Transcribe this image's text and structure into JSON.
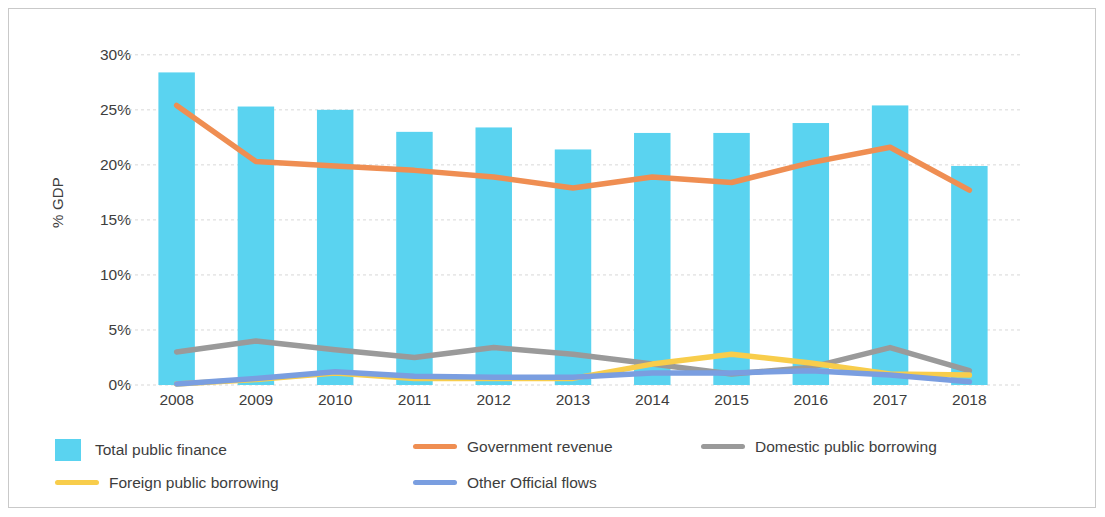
{
  "chart_data": {
    "type": "bar",
    "title": "",
    "xlabel": "",
    "ylabel": "% GDP",
    "categories": [
      "2008",
      "2009",
      "2010",
      "2011",
      "2012",
      "2013",
      "2014",
      "2015",
      "2016",
      "2017",
      "2018"
    ],
    "ylim": [
      0,
      30
    ],
    "ytick_labels": [
      "0%",
      "5%",
      "10%",
      "15%",
      "20%",
      "25%",
      "30%"
    ],
    "ytick_values": [
      0,
      5,
      10,
      15,
      20,
      25,
      30
    ],
    "grid": true,
    "legend_position": "bottom",
    "series": [
      {
        "name": "Total public finance",
        "kind": "bar",
        "color": "#5ad3f0",
        "values": [
          28.4,
          25.3,
          25.0,
          23.0,
          23.4,
          21.4,
          22.9,
          22.9,
          23.8,
          25.4,
          19.9
        ]
      },
      {
        "name": "Government revenue",
        "kind": "line",
        "color": "#ef8e52",
        "values": [
          25.4,
          20.3,
          19.9,
          19.5,
          18.9,
          17.9,
          18.9,
          18.4,
          20.2,
          21.6,
          17.7
        ]
      },
      {
        "name": "Domestic public borrowing",
        "kind": "line",
        "color": "#9a9a9a",
        "values": [
          3.0,
          4.0,
          3.2,
          2.5,
          3.4,
          2.8,
          1.9,
          1.0,
          1.6,
          3.4,
          1.3
        ]
      },
      {
        "name": "Foreign public borrowing",
        "kind": "line",
        "color": "#f8cd4b",
        "values": [
          0.1,
          0.5,
          1.1,
          0.6,
          0.6,
          0.6,
          1.9,
          2.8,
          2.0,
          1.0,
          0.9
        ]
      },
      {
        "name": "Other Official flows",
        "kind": "line",
        "color": "#7a9ee0",
        "values": [
          0.1,
          0.6,
          1.2,
          0.8,
          0.7,
          0.7,
          1.1,
          1.1,
          1.3,
          0.9,
          0.3
        ]
      }
    ]
  },
  "legend": {
    "items": [
      {
        "label": "Total public finance",
        "marker": "square",
        "color": "#5ad3f0"
      },
      {
        "label": "Government revenue",
        "marker": "line",
        "color": "#ef8e52"
      },
      {
        "label": "Domestic public borrowing",
        "marker": "line",
        "color": "#9a9a9a"
      },
      {
        "label": "Foreign public borrowing",
        "marker": "line",
        "color": "#f8cd4b"
      },
      {
        "label": "Other Official flows",
        "marker": "line",
        "color": "#7a9ee0"
      }
    ]
  }
}
